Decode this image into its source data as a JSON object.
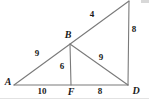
{
  "figure": {
    "kind": "geometry-diagram",
    "stroke_color": "#7a7a7a",
    "label_color": "#1a1a1a",
    "background_color": "#ffffff",
    "width": 149,
    "height": 99,
    "vertices": [
      {
        "name": "A",
        "label": "A",
        "x": 14,
        "y": 85,
        "label_x": 8,
        "label_y": 82,
        "labeled": true
      },
      {
        "name": "B",
        "label": "B",
        "x": 70,
        "y": 44,
        "label_x": 68,
        "label_y": 35,
        "labeled": true
      },
      {
        "name": "F",
        "label": "F",
        "x": 72,
        "y": 85,
        "label_x": 71,
        "label_y": 92,
        "labeled": true
      },
      {
        "name": "D",
        "label": "D",
        "x": 128,
        "y": 85,
        "label_x": 136,
        "label_y": 91,
        "labeled": true
      },
      {
        "name": "top",
        "label": "",
        "x": 129,
        "y": 1,
        "label_x": 129,
        "label_y": 1,
        "labeled": false
      }
    ],
    "segments": [
      {
        "name": "A-to-top",
        "x1": 14,
        "y1": 85,
        "x2": 129,
        "y2": 1
      },
      {
        "name": "A-to-D",
        "x1": 14,
        "y1": 85,
        "x2": 128,
        "y2": 85
      },
      {
        "name": "B-to-F",
        "x1": 70,
        "y1": 44,
        "x2": 71,
        "y2": 85
      },
      {
        "name": "B-to-D",
        "x1": 70,
        "y1": 44,
        "x2": 128,
        "y2": 85
      },
      {
        "name": "D-to-top",
        "x1": 128,
        "y1": 85,
        "x2": 129,
        "y2": 1
      }
    ],
    "measures": [
      {
        "name": "AB",
        "value": "9",
        "x": 37,
        "y": 53
      },
      {
        "name": "B-top",
        "value": "4",
        "x": 92,
        "y": 14
      },
      {
        "name": "BF",
        "value": "6",
        "x": 62,
        "y": 66
      },
      {
        "name": "BD",
        "value": "9",
        "x": 101,
        "y": 57
      },
      {
        "name": "D-top",
        "value": "8",
        "x": 134,
        "y": 29
      },
      {
        "name": "AF",
        "value": "10",
        "x": 42,
        "y": 91
      },
      {
        "name": "FD",
        "value": "8",
        "x": 100,
        "y": 91
      }
    ]
  }
}
